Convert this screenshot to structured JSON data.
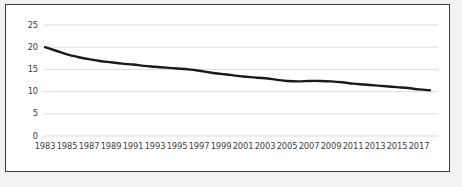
{
  "figure": {
    "background_color": "#f2f2f0",
    "plot_background_color": "#ffffff",
    "border_color": "#3b3b3b",
    "gridline_color": "#d9d9d9",
    "line_color": "#1a1a1a"
  },
  "chart_data": {
    "type": "line",
    "title": "",
    "subtitle": "",
    "xlabel": "",
    "ylabel": "",
    "grid": true,
    "grid_axis": "y",
    "legend": false,
    "legend_position": "none",
    "markers": false,
    "line_width": 2.4,
    "xlim": [
      1983,
      2018
    ],
    "ylim": [
      0,
      25
    ],
    "ytick_labels": [
      "0",
      "5",
      "10",
      "15",
      "20",
      "25"
    ],
    "ytick_values": [
      0,
      5,
      10,
      15,
      20,
      25
    ],
    "xtick_labels": [
      "1983",
      "1985",
      "1987",
      "1989",
      "1991",
      "1993",
      "1995",
      "1997",
      "1999",
      "2001",
      "2003",
      "2005",
      "2007",
      "2009",
      "2011",
      "2013",
      "2015",
      "2017"
    ],
    "xtick_values": [
      1983,
      1985,
      1987,
      1989,
      1991,
      1993,
      1995,
      1997,
      1999,
      2001,
      2003,
      2005,
      2007,
      2009,
      2011,
      2013,
      2015,
      2017
    ],
    "x": [
      1983,
      1984,
      1985,
      1986,
      1987,
      1988,
      1989,
      1990,
      1991,
      1992,
      1993,
      1994,
      1995,
      1996,
      1997,
      1998,
      1999,
      2000,
      2001,
      2002,
      2003,
      2004,
      2005,
      2006,
      2007,
      2008,
      2009,
      2010,
      2011,
      2012,
      2013,
      2014,
      2015,
      2016,
      2017,
      2018
    ],
    "values": [
      20.0,
      19.2,
      18.4,
      17.8,
      17.3,
      16.9,
      16.6,
      16.3,
      16.1,
      15.8,
      15.6,
      15.4,
      15.2,
      15.0,
      14.7,
      14.3,
      14.0,
      13.7,
      13.4,
      13.2,
      13.0,
      12.7,
      12.4,
      12.3,
      12.4,
      12.4,
      12.3,
      12.1,
      11.8,
      11.6,
      11.4,
      11.2,
      11.0,
      10.8,
      10.5,
      10.3
    ],
    "series": [
      {
        "name": "series-1",
        "values": [
          20.0,
          19.2,
          18.4,
          17.8,
          17.3,
          16.9,
          16.6,
          16.3,
          16.1,
          15.8,
          15.6,
          15.4,
          15.2,
          15.0,
          14.7,
          14.3,
          14.0,
          13.7,
          13.4,
          13.2,
          13.0,
          12.7,
          12.4,
          12.3,
          12.4,
          12.4,
          12.3,
          12.1,
          11.8,
          11.6,
          11.4,
          11.2,
          11.0,
          10.8,
          10.5,
          10.3
        ]
      }
    ]
  }
}
